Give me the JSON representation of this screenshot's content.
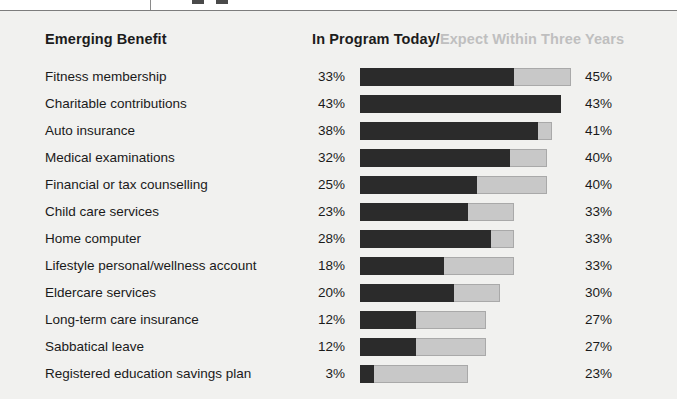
{
  "header": {
    "left_label": "Emerging Benefit",
    "right_today": "In Program Today",
    "right_separator": "/",
    "right_future": "Expect Within Three Years"
  },
  "chart_data": {
    "type": "bar",
    "subtype": "stacked-horizontal",
    "title": "",
    "xlabel": "",
    "ylabel": "Emerging Benefit",
    "grid": false,
    "legend_position": "top-right",
    "xlim": [
      0,
      45
    ],
    "series": [
      {
        "name": "In Program Today",
        "color": "#2b2b2b",
        "values": [
          33,
          43,
          38,
          32,
          25,
          23,
          28,
          18,
          20,
          12,
          12,
          3
        ]
      },
      {
        "name": "Expect Within Three Years",
        "color": "#c8c8c8",
        "values": [
          45,
          43,
          41,
          40,
          40,
          33,
          33,
          33,
          30,
          27,
          27,
          23
        ]
      }
    ],
    "categories": [
      "Fitness membership",
      "Charitable contributions",
      "Auto insurance",
      "Medical examinations",
      "Financial or tax counselling",
      "Child care services",
      "Home computer",
      "Lifestyle personal/wellness account",
      "Eldercare services",
      "Long-term care insurance",
      "Sabbatical leave",
      "Registered education savings plan"
    ],
    "rows": [
      {
        "label": "Fitness membership",
        "today": 33,
        "today_text": "33%",
        "future": 45,
        "future_text": "45%"
      },
      {
        "label": "Charitable contributions",
        "today": 43,
        "today_text": "43%",
        "future": 43,
        "future_text": "43%"
      },
      {
        "label": "Auto insurance",
        "today": 38,
        "today_text": "38%",
        "future": 41,
        "future_text": "41%"
      },
      {
        "label": "Medical examinations",
        "today": 32,
        "today_text": "32%",
        "future": 40,
        "future_text": "40%"
      },
      {
        "label": "Financial or tax counselling",
        "today": 25,
        "today_text": "25%",
        "future": 40,
        "future_text": "40%"
      },
      {
        "label": "Child care services",
        "today": 23,
        "today_text": "23%",
        "future": 33,
        "future_text": "33%"
      },
      {
        "label": "Home computer",
        "today": 28,
        "today_text": "28%",
        "future": 33,
        "future_text": "33%"
      },
      {
        "label": "Lifestyle personal/wellness account",
        "today": 18,
        "today_text": "18%",
        "future": 33,
        "future_text": "33%"
      },
      {
        "label": "Eldercare services",
        "today": 20,
        "today_text": "20%",
        "future": 30,
        "future_text": "30%"
      },
      {
        "label": "Long-term care insurance",
        "today": 12,
        "today_text": "12%",
        "future": 27,
        "future_text": "27%"
      },
      {
        "label": "Sabbatical leave",
        "today": 12,
        "today_text": "12%",
        "future": 27,
        "future_text": "27%"
      },
      {
        "label": "Registered education savings plan",
        "today": 3,
        "today_text": "3%",
        "future": 23,
        "future_text": "23%"
      }
    ]
  },
  "colors": {
    "background": "#f1f1ef",
    "page": "#ffffff",
    "bar_today": "#2b2b2b",
    "bar_future": "#c8c8c8",
    "bar_future_border": "#a9a9a9",
    "text": "#1a1a1a",
    "text_muted": "#bfbfbf"
  },
  "scale": {
    "pixels_per_percent": 4.68,
    "bar_origin_x": 360
  }
}
